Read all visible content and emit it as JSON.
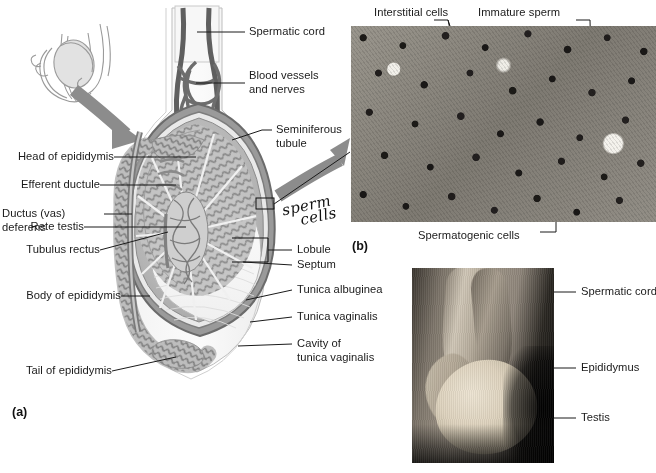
{
  "figure": {
    "panel_a_tag": "(a)",
    "panel_b_tag": "(b)"
  },
  "panel_a": {
    "name": "sagittal-section-of-testis-and-epididymis",
    "left_labels": [
      {
        "id": "head-of-epididymis",
        "text": "Head of epididymis"
      },
      {
        "id": "efferent-ductule",
        "text": "Efferent ductule"
      },
      {
        "id": "ductus-vas-deferens",
        "text": "Ductus (vas)\ndeferens"
      },
      {
        "id": "rete-testis",
        "text": "Rete testis"
      },
      {
        "id": "tubulus-rectus",
        "text": "Tubulus rectus"
      },
      {
        "id": "body-of-epididymis",
        "text": "Body of epididymis"
      },
      {
        "id": "tail-of-epididymis",
        "text": "Tail of epididymis"
      }
    ],
    "right_labels": [
      {
        "id": "spermatic-cord",
        "text": "Spermatic cord"
      },
      {
        "id": "blood-vessels-and-nerves",
        "text": "Blood vessels\nand nerves"
      },
      {
        "id": "seminiferous-tubule",
        "text": "Seminiferous\ntubule"
      },
      {
        "id": "lobule",
        "text": "Lobule"
      },
      {
        "id": "septum",
        "text": "Septum"
      },
      {
        "id": "tunica-albuginea",
        "text": "Tunica albuginea"
      },
      {
        "id": "tunica-vaginalis",
        "text": "Tunica vaginalis"
      },
      {
        "id": "cavity-of-tunica-vaginalis",
        "text": "Cavity of\ntunica vaginalis"
      }
    ],
    "handwritten_note": {
      "line1": "sperm",
      "line2": "cells"
    }
  },
  "panel_b": {
    "name": "testis-histology-micrograph",
    "labels": [
      {
        "id": "interstitial-cells",
        "text": "Interstitial cells"
      },
      {
        "id": "immature-sperm",
        "text": "Immature sperm"
      },
      {
        "id": "spermatogenic-cells",
        "text": "Spermatogenic cells"
      }
    ]
  },
  "panel_c": {
    "name": "cadaver-photograph-of-testis",
    "labels": [
      {
        "id": "spermatic-cord",
        "text": "Spermatic cord"
      },
      {
        "id": "epididymus",
        "text": "Epididymus"
      },
      {
        "id": "testis",
        "text": "Testis"
      }
    ]
  },
  "colors": {
    "text": "#1a1a1a",
    "leader_line": "#1a1a1a",
    "arrow_gray": "#8c8c8c",
    "tubule_gray": "#8f8f8f",
    "tunica_dark": "#6b6b6b",
    "background": "#ffffff"
  }
}
